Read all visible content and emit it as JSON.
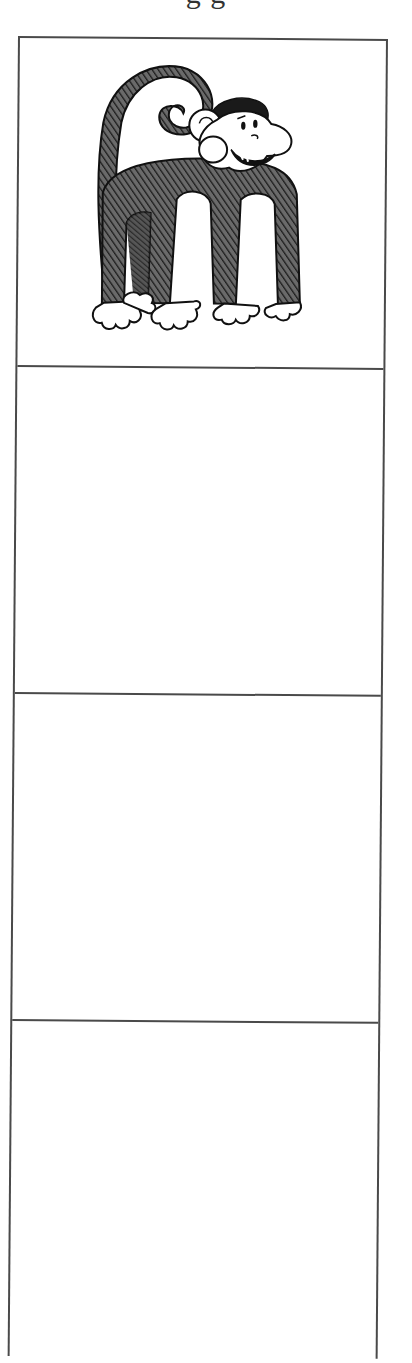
{
  "page": {
    "heading_visible_fragment": "g  g",
    "heading_note": "cropped"
  },
  "worksheet": {
    "letter": "m",
    "cells": [
      {
        "index": 1,
        "content": "illustration",
        "illustration": "monkey shaped like letter m"
      },
      {
        "index": 2,
        "content": "empty"
      },
      {
        "index": 3,
        "content": "empty"
      },
      {
        "index": 4,
        "content": "empty"
      }
    ],
    "colors": {
      "border": "#4a4a4a",
      "ink": "#1a1a1a",
      "fur": "#3a3a3a",
      "paper": "#ffffff"
    }
  }
}
